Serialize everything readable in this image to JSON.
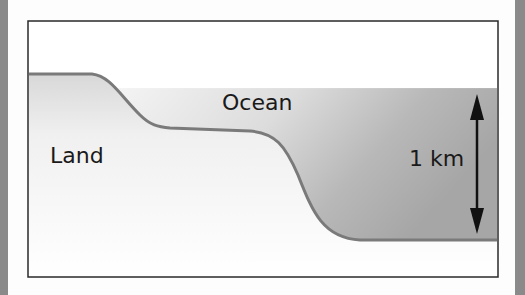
{
  "diagram": {
    "labels": {
      "land": "Land",
      "ocean": "Ocean",
      "depth": "1 km"
    },
    "colors": {
      "frame": "#2a2a2a",
      "seabed_edge": "#7a7a7a",
      "ocean_light": "#f2f2f2",
      "ocean_dark": "#a9a9a9",
      "arrow": "#111111",
      "border": "#8a8a8a"
    }
  }
}
